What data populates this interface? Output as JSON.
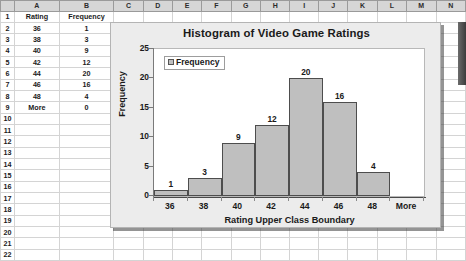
{
  "spreadsheet": {
    "column_headers": [
      "A",
      "B",
      "C",
      "D",
      "E",
      "F",
      "G",
      "H",
      "I",
      "J",
      "K",
      "L",
      "M",
      "N"
    ],
    "row_headers": [
      "1",
      "2",
      "3",
      "4",
      "5",
      "6",
      "7",
      "8",
      "9",
      "10",
      "11",
      "12",
      "13",
      "14",
      "15",
      "16",
      "17",
      "18",
      "19",
      "20",
      "21",
      "22"
    ],
    "table_headers": [
      "Rating",
      "Frequency"
    ],
    "rows": [
      {
        "rating": "36",
        "frequency": "1"
      },
      {
        "rating": "38",
        "frequency": "3"
      },
      {
        "rating": "40",
        "frequency": "9"
      },
      {
        "rating": "42",
        "frequency": "12"
      },
      {
        "rating": "44",
        "frequency": "20"
      },
      {
        "rating": "46",
        "frequency": "16"
      },
      {
        "rating": "48",
        "frequency": "4"
      },
      {
        "rating": "More",
        "frequency": "0"
      }
    ]
  },
  "chart_data": {
    "type": "bar",
    "title": "Histogram of Video Game Ratings",
    "xlabel": "Rating Upper Class Boundary",
    "ylabel": "Frequency",
    "categories": [
      "36",
      "38",
      "40",
      "42",
      "44",
      "46",
      "48",
      "More"
    ],
    "values": [
      1,
      3,
      9,
      12,
      20,
      16,
      4,
      0
    ],
    "data_labels": [
      "1",
      "3",
      "9",
      "12",
      "20",
      "16",
      "4",
      ""
    ],
    "series": [
      {
        "name": "Frequency",
        "values": [
          1,
          3,
          9,
          12,
          20,
          16,
          4,
          0
        ]
      }
    ],
    "legend": {
      "entries": [
        "Frequency"
      ],
      "position": "top-left-inside"
    },
    "ylim": [
      0,
      25
    ],
    "yticks": [
      "0",
      "5",
      "10",
      "15",
      "20",
      "25"
    ],
    "grid": false,
    "bar_fill": "#bfbfbf",
    "bar_border": "#4d4d4d",
    "plot_background": "#ffffff",
    "chart_background": "#ececec"
  }
}
